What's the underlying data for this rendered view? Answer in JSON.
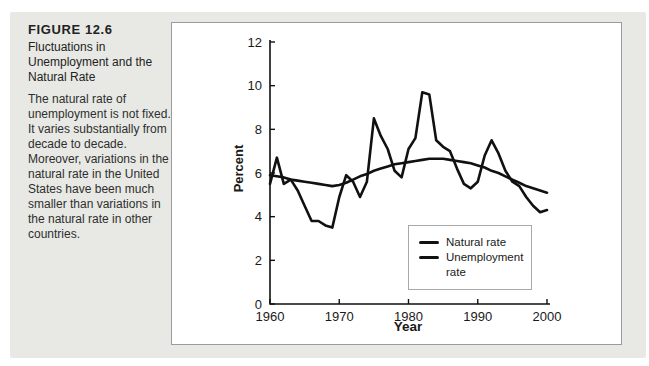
{
  "figure": {
    "label": "FIGURE 12.6",
    "title": "Fluctuations in Unemployment and the Natural Rate",
    "body": "The natural rate of unemployment is not fixed. It varies substantially from decade to decade. Moreover, variations in the natural rate in the United States have been much smaller than variations in the natural rate in other countries."
  },
  "colors": {
    "figure_bg": "#e8e9e4",
    "panel_bg": "#ffffff",
    "panel_border": "#9b9b9b",
    "axis": "#111111",
    "line": "#111111",
    "text": "#1a1a1a"
  },
  "chart_data": {
    "type": "line",
    "title": "",
    "xlabel": "Year",
    "ylabel": "Percent",
    "xlim": [
      1960,
      2000
    ],
    "ylim": [
      0,
      12
    ],
    "x_ticks": [
      1960,
      1970,
      1980,
      1990,
      2000
    ],
    "y_ticks": [
      0,
      2,
      4,
      6,
      8,
      10,
      12
    ],
    "grid": false,
    "legend_position": "inside-lower-right",
    "x": [
      1960,
      1961,
      1962,
      1963,
      1964,
      1965,
      1966,
      1967,
      1968,
      1969,
      1970,
      1971,
      1972,
      1973,
      1974,
      1975,
      1976,
      1977,
      1978,
      1979,
      1980,
      1981,
      1982,
      1983,
      1984,
      1985,
      1986,
      1987,
      1988,
      1989,
      1990,
      1991,
      1992,
      1993,
      1994,
      1995,
      1996,
      1997,
      1998,
      1999,
      2000
    ],
    "series": [
      {
        "name": "Natural rate",
        "values": [
          5.9,
          5.85,
          5.8,
          5.7,
          5.65,
          5.6,
          5.55,
          5.5,
          5.45,
          5.4,
          5.45,
          5.55,
          5.7,
          5.85,
          5.95,
          6.1,
          6.2,
          6.3,
          6.4,
          6.45,
          6.5,
          6.55,
          6.6,
          6.65,
          6.65,
          6.65,
          6.6,
          6.55,
          6.5,
          6.45,
          6.35,
          6.25,
          6.1,
          6.0,
          5.85,
          5.7,
          5.55,
          5.4,
          5.3,
          5.2,
          5.1
        ]
      },
      {
        "name": "Unemployment rate",
        "values": [
          5.5,
          6.7,
          5.5,
          5.7,
          5.2,
          4.5,
          3.8,
          3.8,
          3.6,
          3.5,
          4.9,
          5.9,
          5.6,
          4.9,
          5.6,
          8.5,
          7.7,
          7.1,
          6.1,
          5.8,
          7.1,
          7.6,
          9.7,
          9.6,
          7.5,
          7.2,
          7.0,
          6.2,
          5.5,
          5.3,
          5.6,
          6.8,
          7.5,
          6.9,
          6.1,
          5.6,
          5.4,
          4.9,
          4.5,
          4.2,
          4.3
        ]
      }
    ]
  },
  "legend": {
    "items": [
      {
        "label": "Natural rate"
      },
      {
        "label": "Unemployment rate"
      }
    ]
  }
}
